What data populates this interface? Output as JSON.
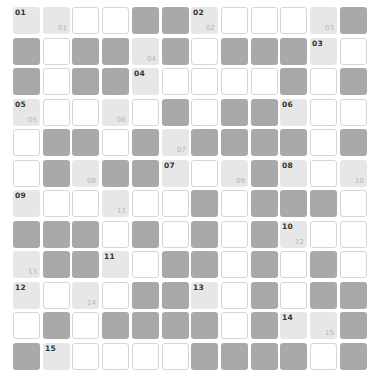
{
  "puzzle": {
    "legend": {
      "D": "blocked",
      "L": "clue",
      "W": "empty"
    },
    "colors": {
      "blocked": "#a9a9a9",
      "clue": "#e7e7e7",
      "empty": "#ffffff",
      "border": "#d6d6d6"
    },
    "rows": [
      [
        "L",
        "L",
        "W",
        "W",
        "D",
        "D",
        "L",
        "W",
        "W",
        "W",
        "L",
        "D"
      ],
      [
        "D",
        "W",
        "D",
        "D",
        "L",
        "D",
        "W",
        "D",
        "D",
        "D",
        "L",
        "W"
      ],
      [
        "D",
        "W",
        "D",
        "D",
        "L",
        "W",
        "W",
        "W",
        "W",
        "D",
        "W",
        "D"
      ],
      [
        "L",
        "W",
        "W",
        "L",
        "W",
        "D",
        "W",
        "D",
        "D",
        "L",
        "W",
        "W"
      ],
      [
        "W",
        "D",
        "D",
        "W",
        "D",
        "L",
        "D",
        "D",
        "D",
        "D",
        "W",
        "D"
      ],
      [
        "W",
        "D",
        "L",
        "D",
        "D",
        "L",
        "W",
        "L",
        "D",
        "L",
        "W",
        "L"
      ],
      [
        "L",
        "W",
        "W",
        "L",
        "W",
        "W",
        "D",
        "W",
        "D",
        "D",
        "D",
        "W"
      ],
      [
        "D",
        "D",
        "D",
        "W",
        "D",
        "W",
        "D",
        "W",
        "D",
        "L",
        "W",
        "W"
      ],
      [
        "L",
        "D",
        "D",
        "L",
        "W",
        "D",
        "D",
        "W",
        "D",
        "W",
        "D",
        "W"
      ],
      [
        "L",
        "W",
        "L",
        "W",
        "D",
        "D",
        "L",
        "W",
        "D",
        "W",
        "D",
        "D"
      ],
      [
        "W",
        "D",
        "W",
        "D",
        "D",
        "D",
        "D",
        "W",
        "D",
        "L",
        "L",
        "D"
      ],
      [
        "D",
        "L",
        "W",
        "W",
        "W",
        "W",
        "D",
        "D",
        "D",
        "D",
        "W",
        "D"
      ]
    ],
    "top_labels": [
      {
        "r": 0,
        "c": 0,
        "t": "01"
      },
      {
        "r": 0,
        "c": 6,
        "t": "02"
      },
      {
        "r": 1,
        "c": 10,
        "t": "03"
      },
      {
        "r": 2,
        "c": 4,
        "t": "04"
      },
      {
        "r": 3,
        "c": 0,
        "t": "05"
      },
      {
        "r": 3,
        "c": 9,
        "t": "06"
      },
      {
        "r": 5,
        "c": 5,
        "t": "07"
      },
      {
        "r": 5,
        "c": 9,
        "t": "08"
      },
      {
        "r": 6,
        "c": 0,
        "t": "09"
      },
      {
        "r": 7,
        "c": 9,
        "t": "10"
      },
      {
        "r": 8,
        "c": 3,
        "t": "11"
      },
      {
        "r": 9,
        "c": 0,
        "t": "12"
      },
      {
        "r": 9,
        "c": 6,
        "t": "13"
      },
      {
        "r": 10,
        "c": 9,
        "t": "14"
      },
      {
        "r": 11,
        "c": 1,
        "t": "15"
      }
    ],
    "corner_labels": [
      {
        "r": 0,
        "c": 1,
        "t": "01"
      },
      {
        "r": 0,
        "c": 6,
        "t": "02"
      },
      {
        "r": 0,
        "c": 10,
        "t": "03"
      },
      {
        "r": 1,
        "c": 4,
        "t": "04"
      },
      {
        "r": 3,
        "c": 0,
        "t": "05"
      },
      {
        "r": 3,
        "c": 3,
        "t": "06"
      },
      {
        "r": 4,
        "c": 5,
        "t": "07"
      },
      {
        "r": 5,
        "c": 2,
        "t": "08"
      },
      {
        "r": 5,
        "c": 7,
        "t": "09"
      },
      {
        "r": 5,
        "c": 11,
        "t": "10"
      },
      {
        "r": 6,
        "c": 3,
        "t": "11"
      },
      {
        "r": 7,
        "c": 9,
        "t": "12"
      },
      {
        "r": 8,
        "c": 0,
        "t": "13"
      },
      {
        "r": 9,
        "c": 2,
        "t": "14"
      },
      {
        "r": 10,
        "c": 10,
        "t": "15"
      }
    ]
  }
}
